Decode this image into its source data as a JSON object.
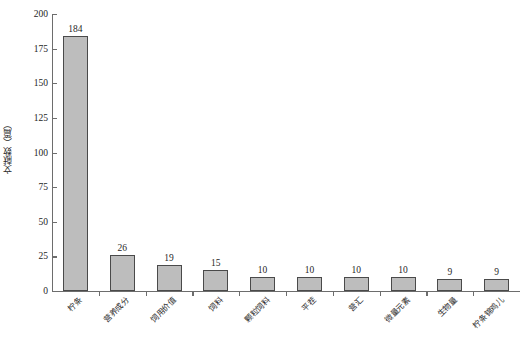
{
  "chart_data": {
    "type": "bar",
    "title": "",
    "subtitle": "",
    "xlabel": "",
    "ylabel": "文献数（篇）",
    "ylim": [
      0,
      200
    ],
    "ytick_values": [
      0,
      25,
      50,
      75,
      100,
      125,
      150,
      175,
      200
    ],
    "ytick_labels": [
      "0",
      "25",
      "50",
      "75",
      "100",
      "125",
      "150",
      "175",
      "200"
    ],
    "grid": false,
    "legend": null,
    "legend_position": "none",
    "categories": [
      "柠条",
      "营养成分",
      "饲用价值",
      "饲料",
      "颗粒饲料",
      "平茬",
      "营汇",
      "微量元素",
      "生物量",
      "柠条锦鸡儿"
    ],
    "values": [
      184,
      26,
      19,
      15,
      10,
      10,
      10,
      10,
      9,
      9
    ],
    "data_labels": [
      "184",
      "26",
      "19",
      "15",
      "10",
      "10",
      "10",
      "10",
      "9",
      "9"
    ],
    "bar_fill_color": "#bdbdbd",
    "bar_edge_color": "#4a4a4a",
    "axis_color": "#6d6d6d",
    "text_color": "#1f1f1f",
    "background_color": "#ffffff",
    "xtick_label_rotation": -45
  }
}
